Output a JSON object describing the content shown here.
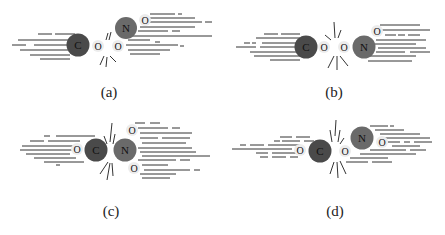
{
  "figure": {
    "colors": {
      "carbon": "#4a4a4a",
      "nitrogen": "#6a6a6a",
      "oxygen": "#e8e8e8",
      "streak": "#333333",
      "label": "#111111"
    },
    "panels": [
      {
        "id": "a",
        "caption": "(a)",
        "atoms": [
          "C",
          "O",
          "O",
          "N",
          "O"
        ],
        "description": "C and O separated from O-N-O; NO2 fragment tilted upward to the right"
      },
      {
        "id": "b",
        "caption": "(b)",
        "atoms": [
          "C",
          "O",
          "O",
          "N",
          "O"
        ],
        "description": "C-O and O-N-O fragments separating horizontally"
      },
      {
        "id": "c",
        "caption": "(c)",
        "atoms": [
          "O",
          "C",
          "N",
          "O",
          "O"
        ],
        "description": "O-C and N(O)(O) fragments separating, NO2 with oxygens above and below"
      },
      {
        "id": "d",
        "caption": "(d)",
        "atoms": [
          "O",
          "C",
          "O",
          "N",
          "O"
        ],
        "description": "O-C and O-N-O fragments separating, NO2 tilted upward"
      }
    ]
  }
}
